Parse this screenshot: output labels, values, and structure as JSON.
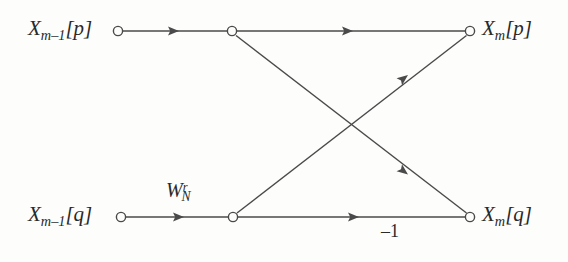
{
  "figure": {
    "name": "fft-butterfly-signal-flow-graph",
    "type": "signal-flow-diagram",
    "background_color": "#fdfdfc",
    "line_color": "#4a4a4a",
    "text_color": "#2a2a2a"
  },
  "labels": {
    "input_top": {
      "base": "X",
      "sub": "m–1",
      "bracket": "[p]",
      "text": "X_{m-1}[p]"
    },
    "input_bottom": {
      "base": "X",
      "sub": "m–1",
      "bracket": "[q]",
      "text": "X_{m-1}[q]"
    },
    "output_top": {
      "base": "X",
      "sub": "m",
      "bracket": "[p]",
      "text": "X_m[p]"
    },
    "output_bottom": {
      "base": "X",
      "sub": "m",
      "bracket": "[q]",
      "text": "X_m[q]"
    },
    "twiddle_factor": {
      "base": "W",
      "sub": "N",
      "sup": "r",
      "text": "W_N^r"
    },
    "negative_one": "–1"
  },
  "nodes": [
    {
      "name": "node-input-top",
      "x": 118,
      "y": 31,
      "r": 5
    },
    {
      "name": "node-mid-top",
      "x": 232,
      "y": 31,
      "r": 5
    },
    {
      "name": "node-output-top",
      "x": 470,
      "y": 31,
      "r": 5
    },
    {
      "name": "node-input-bottom",
      "x": 121,
      "y": 217,
      "r": 5
    },
    {
      "name": "node-mid-bottom",
      "x": 233,
      "y": 217,
      "r": 5
    },
    {
      "name": "node-output-bottom",
      "x": 470,
      "y": 217,
      "r": 5
    }
  ],
  "edges": [
    {
      "name": "edge-input-top-to-mid-top",
      "from": [
        123,
        31
      ],
      "to": [
        227,
        31
      ],
      "arrow_at": [
        178,
        31
      ],
      "angle": 0
    },
    {
      "name": "edge-mid-top-to-output-top",
      "from": [
        237,
        31
      ],
      "to": [
        465,
        31
      ],
      "arrow_at": [
        352,
        31
      ],
      "angle": 0
    },
    {
      "name": "edge-input-bottom-to-mid-bottom",
      "from": [
        126,
        217
      ],
      "to": [
        228,
        217
      ],
      "arrow_at": [
        183,
        217
      ],
      "angle": 0
    },
    {
      "name": "edge-mid-bottom-to-output-bottom",
      "from": [
        238,
        217
      ],
      "to": [
        465,
        217
      ],
      "arrow_at": [
        358,
        217
      ],
      "angle": 0
    },
    {
      "name": "edge-mid-top-to-output-bottom",
      "from": [
        236,
        35
      ],
      "to": [
        467,
        213
      ],
      "arrow_at": [
        405,
        172
      ],
      "angle": 37.6
    },
    {
      "name": "edge-mid-bottom-to-output-top",
      "from": [
        237,
        213
      ],
      "to": [
        467,
        35
      ],
      "arrow_at": [
        405,
        78
      ],
      "angle": -37.7
    }
  ]
}
